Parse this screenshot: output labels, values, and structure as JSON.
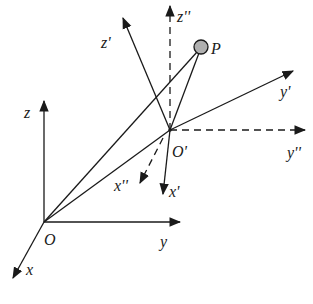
{
  "diagram": {
    "title": "",
    "frames": [
      {
        "name": "O-xyz",
        "origin_label": "O",
        "axes": [
          "x",
          "y",
          "z"
        ],
        "style": "solid"
      },
      {
        "name": "O'-x'y'z'",
        "origin_label": "O'",
        "axes": [
          "x'",
          "y'",
          "z'"
        ],
        "style": "solid"
      },
      {
        "name": "O'-x''y''z''",
        "origin_label": "O'",
        "axes": [
          "x''",
          "y''",
          "z''"
        ],
        "style": "dashed"
      }
    ],
    "point": {
      "label": "P",
      "fill": "#b0b0b0"
    },
    "labels": {
      "O": "O",
      "x": "x",
      "y": "y",
      "z": "z",
      "O_prime": "O'",
      "x_prime": "x'",
      "y_prime": "y'",
      "z_prime": "z'",
      "x_dprime": "x''",
      "y_dprime": "y''",
      "z_dprime": "z''",
      "P": "P"
    },
    "colors": {
      "line": "#1a1a1a",
      "point_fill": "#b0b0b0",
      "background": "#ffffff"
    }
  }
}
